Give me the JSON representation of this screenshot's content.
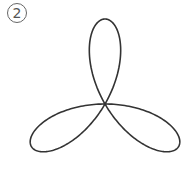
{
  "figure": {
    "label": "2",
    "shape": "six-petal rose curve",
    "center": [
      105,
      104
    ],
    "petal_length": 85,
    "stroke_color": "#333333"
  }
}
